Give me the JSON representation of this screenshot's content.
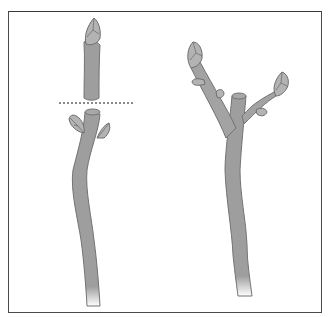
{
  "figure": {
    "type": "pruning-illustration",
    "panels": [
      {
        "id": "before-cut",
        "description": "Stem with terminal bud removed above a pair of side buds; dotted cut line"
      },
      {
        "id": "after-growth",
        "description": "Cut stem with two side shoots grown from the buds"
      }
    ]
  },
  "colors": {
    "frame": "#4a4a4a",
    "stem_fill": "#9e9e9e",
    "stem_outline": "#737373",
    "bud_fill": "#b3b3b3",
    "bud_outline": "#6e6e6e",
    "cut_line": "#8a8a8a",
    "background": "#ffffff"
  }
}
